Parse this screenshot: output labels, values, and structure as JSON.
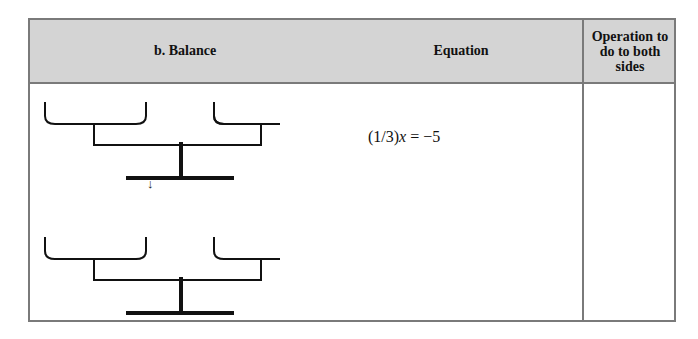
{
  "table": {
    "headers": {
      "balance": "b.  Balance",
      "equation": "Equation",
      "operation": "Operation to do to both sides"
    },
    "rows": [
      {
        "equation_prefix": "(1/3)",
        "equation_var": "x",
        "equation_suffix": " = −5",
        "operation": ""
      }
    ],
    "arrow": "↓",
    "balances": [
      {
        "name": "top-balance",
        "state": "level"
      },
      {
        "name": "bottom-balance",
        "state": "level"
      }
    ]
  }
}
